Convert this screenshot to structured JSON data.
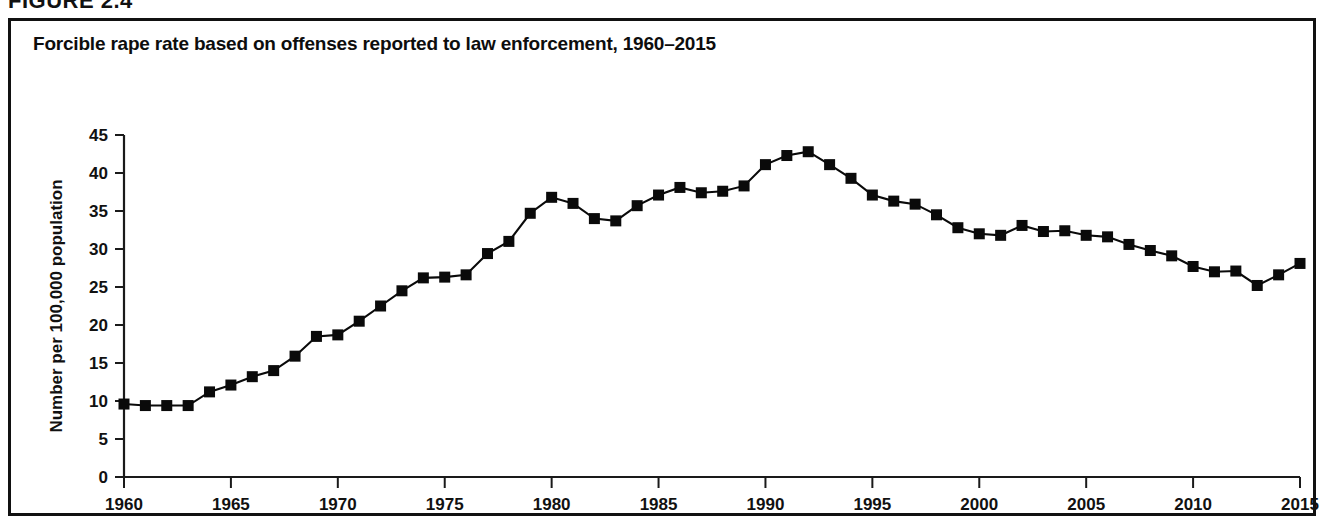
{
  "figure": {
    "eyebrow": "FIGURE 2.4",
    "title": "Forcible rape rate based on offenses reported to law enforcement, 1960–2015"
  },
  "chart_data": {
    "type": "line",
    "title": "Forcible rape rate based on offenses reported to law enforcement, 1960–2015",
    "xlabel": "",
    "ylabel": "Number per 100,000 population",
    "xlim": [
      1960,
      2015
    ],
    "ylim": [
      0,
      45
    ],
    "ytick_labels": [
      "0",
      "5",
      "10",
      "15",
      "20",
      "25",
      "30",
      "35",
      "40",
      "45"
    ],
    "yticks": [
      0,
      5,
      10,
      15,
      20,
      25,
      30,
      35,
      40,
      45
    ],
    "xtick_labels": [
      "1960",
      "1965",
      "1970",
      "1975",
      "1980",
      "1985",
      "1990",
      "1995",
      "2000",
      "2005",
      "2010",
      "2015"
    ],
    "xticks": [
      1960,
      1965,
      1970,
      1975,
      1980,
      1985,
      1990,
      1995,
      2000,
      2005,
      2010,
      2015
    ],
    "grid": false,
    "legend": null,
    "marker": "square",
    "line_color": "#0a0a0a",
    "marker_color": "#0a0a0a",
    "x": [
      1960,
      1961,
      1962,
      1963,
      1964,
      1965,
      1966,
      1967,
      1968,
      1969,
      1970,
      1971,
      1972,
      1973,
      1974,
      1975,
      1976,
      1977,
      1978,
      1979,
      1980,
      1981,
      1982,
      1983,
      1984,
      1985,
      1986,
      1987,
      1988,
      1989,
      1990,
      1991,
      1992,
      1993,
      1994,
      1995,
      1996,
      1997,
      1998,
      1999,
      2000,
      2001,
      2002,
      2003,
      2004,
      2005,
      2006,
      2007,
      2008,
      2009,
      2010,
      2011,
      2012,
      2013,
      2014,
      2015
    ],
    "y": [
      9.6,
      9.4,
      9.4,
      9.4,
      11.2,
      12.1,
      13.2,
      14.0,
      15.9,
      18.5,
      18.7,
      20.5,
      22.5,
      24.5,
      26.2,
      26.3,
      26.6,
      29.4,
      31.0,
      34.7,
      36.8,
      36.0,
      34.0,
      33.7,
      35.7,
      37.1,
      38.1,
      37.4,
      37.6,
      38.3,
      41.1,
      42.3,
      42.8,
      41.1,
      39.3,
      37.1,
      36.3,
      35.9,
      34.5,
      32.8,
      32.0,
      31.8,
      33.1,
      32.3,
      32.4,
      31.8,
      31.6,
      30.6,
      29.8,
      29.1,
      27.7,
      27.0,
      27.1,
      25.2,
      26.6,
      28.1
    ]
  }
}
